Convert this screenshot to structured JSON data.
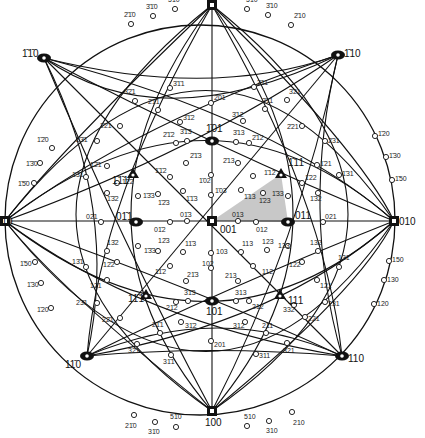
{
  "diagram": {
    "type": "stereographic-projection",
    "center": {
      "x": 212,
      "y": 221
    },
    "radius": 192,
    "shading_color": "#c8c8c8",
    "line_color": "#111111"
  },
  "fundamental_triangle": [
    [
      212,
      221
    ],
    [
      281,
      174
    ],
    [
      288,
      222
    ]
  ],
  "major_poles": [
    {
      "label": "1̄00",
      "x": 212,
      "y": 5,
      "shape": "square",
      "lx": 206,
      "ly": -3
    },
    {
      "label": "100",
      "x": 212,
      "y": 411,
      "shape": "square",
      "lx": 205,
      "ly": 426
    },
    {
      "label": "010",
      "x": 5,
      "y": 221,
      "shape": "square",
      "lx": -4,
      "ly": 225
    },
    {
      "label": "010",
      "x": 394,
      "y": 221,
      "shape": "square",
      "lx": 399,
      "ly": 225
    },
    {
      "label": "001",
      "x": 212,
      "y": 221,
      "shape": "square",
      "lx": 220,
      "ly": 233
    },
    {
      "label": "1̄1̄0",
      "x": 44,
      "y": 58,
      "shape": "oval",
      "lx": 22,
      "ly": 57
    },
    {
      "label": "1̄10",
      "x": 338,
      "y": 55,
      "shape": "oval",
      "lx": 344,
      "ly": 57
    },
    {
      "label": "11̄0",
      "x": 87,
      "y": 356,
      "shape": "oval",
      "lx": 65,
      "ly": 368
    },
    {
      "label": "110",
      "x": 342,
      "y": 356,
      "shape": "oval",
      "lx": 348,
      "ly": 362
    },
    {
      "label": "1̄01",
      "x": 212,
      "y": 141,
      "shape": "oval",
      "lx": 206,
      "ly": 132
    },
    {
      "label": "101",
      "x": 212,
      "y": 301,
      "shape": "oval",
      "lx": 206,
      "ly": 315
    },
    {
      "label": "01̄1",
      "x": 136,
      "y": 222,
      "shape": "oval",
      "lx": 116,
      "ly": 220
    },
    {
      "label": "011",
      "x": 288,
      "y": 222,
      "shape": "oval",
      "lx": 295,
      "ly": 219
    },
    {
      "label": "1̄1̄1",
      "x": 133,
      "y": 174,
      "shape": "triangle",
      "lx": 112,
      "ly": 184
    },
    {
      "label": "1̄11",
      "x": 281,
      "y": 174,
      "shape": "triangle",
      "lx": 288,
      "ly": 166
    },
    {
      "label": "11̄1",
      "x": 146,
      "y": 295,
      "shape": "triangle",
      "lx": 128,
      "ly": 302
    },
    {
      "label": "111",
      "x": 280,
      "y": 295,
      "shape": "triangle",
      "lx": 288,
      "ly": 304
    }
  ],
  "minor_poles": [
    {
      "label": "5̄1̄0",
      "x": 175,
      "y": 9,
      "lx": 168,
      "ly": 2
    },
    {
      "label": "3̄1̄0",
      "x": 153,
      "y": 16,
      "lx": 146,
      "ly": 9
    },
    {
      "label": "2̄1̄0",
      "x": 131,
      "y": 24,
      "lx": 124,
      "ly": 17
    },
    {
      "label": "5̄10",
      "x": 247,
      "y": 9,
      "lx": 246,
      "ly": 2
    },
    {
      "label": "3̄10",
      "x": 268,
      "y": 15,
      "lx": 266,
      "ly": 8
    },
    {
      "label": "2̄10",
      "x": 291,
      "y": 25,
      "lx": 294,
      "ly": 18
    },
    {
      "label": "1̄2̄0",
      "x": 52,
      "y": 148,
      "lx": 37,
      "ly": 142
    },
    {
      "label": "1̄3̄0",
      "x": 40,
      "y": 163,
      "lx": 26,
      "ly": 166
    },
    {
      "label": "1̄5̄0",
      "x": 34,
      "y": 183,
      "lx": 18,
      "ly": 186
    },
    {
      "label": "1̄20",
      "x": 375,
      "y": 136,
      "lx": 378,
      "ly": 136
    },
    {
      "label": "1̄30",
      "x": 386,
      "y": 157,
      "lx": 389,
      "ly": 158
    },
    {
      "label": "1̄50",
      "x": 392,
      "y": 180,
      "lx": 395,
      "ly": 181
    },
    {
      "label": "1̄50",
      "x": 35,
      "y": 262,
      "lx": 20,
      "ly": 266
    },
    {
      "label": "1̄30",
      "x": 41,
      "y": 283,
      "lx": 27,
      "ly": 287
    },
    {
      "label": "1̄20",
      "x": 51,
      "y": 308,
      "lx": 37,
      "ly": 312
    },
    {
      "label": "150",
      "x": 389,
      "y": 261,
      "lx": 392,
      "ly": 262
    },
    {
      "label": "130",
      "x": 384,
      "y": 280,
      "lx": 387,
      "ly": 282
    },
    {
      "label": "120",
      "x": 374,
      "y": 304,
      "lx": 377,
      "ly": 306
    },
    {
      "label": "21̄0",
      "x": 134,
      "y": 415,
      "lx": 125,
      "ly": 428
    },
    {
      "label": "31̄0",
      "x": 155,
      "y": 422,
      "lx": 148,
      "ly": 434
    },
    {
      "label": "51̄0",
      "x": 176,
      "y": 427,
      "lx": 170,
      "ly": 419
    },
    {
      "label": "510",
      "x": 247,
      "y": 426,
      "lx": 244,
      "ly": 419
    },
    {
      "label": "310",
      "x": 269,
      "y": 421,
      "lx": 266,
      "ly": 433
    },
    {
      "label": "210",
      "x": 292,
      "y": 412,
      "lx": 293,
      "ly": 425
    },
    {
      "label": "3̄2̄1",
      "x": 135,
      "y": 101,
      "lx": 124,
      "ly": 94
    },
    {
      "label": "2̄1̄1",
      "x": 158,
      "y": 110,
      "lx": 148,
      "ly": 104
    },
    {
      "label": "3̄1̄1",
      "x": 170,
      "y": 88,
      "lx": 173,
      "ly": 86
    },
    {
      "label": "2̄01",
      "x": 211,
      "y": 103,
      "lx": 214,
      "ly": 100
    },
    {
      "label": "3̄11",
      "x": 254,
      "y": 87,
      "lx": 257,
      "ly": 85
    },
    {
      "label": "3̄21",
      "x": 287,
      "y": 100,
      "lx": 289,
      "ly": 94
    },
    {
      "label": "2̄11",
      "x": 265,
      "y": 109,
      "lx": 262,
      "ly": 103
    },
    {
      "label": "2̄2̄1",
      "x": 120,
      "y": 126,
      "lx": 100,
      "ly": 128
    },
    {
      "label": "2̄21",
      "x": 302,
      "y": 126,
      "lx": 287,
      "ly": 129
    },
    {
      "label": "3̄1̄2",
      "x": 180,
      "y": 122,
      "lx": 183,
      "ly": 120
    },
    {
      "label": "3̄12",
      "x": 243,
      "y": 121,
      "lx": 232,
      "ly": 117
    },
    {
      "label": "2̄1̄2",
      "x": 176,
      "y": 143,
      "lx": 163,
      "ly": 137
    },
    {
      "label": "3̄1̄3",
      "x": 187,
      "y": 141,
      "lx": 180,
      "ly": 134
    },
    {
      "label": "3̄13",
      "x": 236,
      "y": 142,
      "lx": 233,
      "ly": 135
    },
    {
      "label": "2̄12",
      "x": 249,
      "y": 143,
      "lx": 252,
      "ly": 140
    },
    {
      "label": "2̄3̄1",
      "x": 97,
      "y": 141,
      "lx": 76,
      "ly": 142
    },
    {
      "label": "2̄31",
      "x": 325,
      "y": 141,
      "lx": 328,
      "ly": 143
    },
    {
      "label": "1̄2̄1",
      "x": 107,
      "y": 166,
      "lx": 90,
      "ly": 167
    },
    {
      "label": "1̄21",
      "x": 317,
      "y": 165,
      "lx": 320,
      "ly": 166
    },
    {
      "label": "1̄3̄1",
      "x": 86,
      "y": 177,
      "lx": 72,
      "ly": 177
    },
    {
      "label": "1̄31",
      "x": 339,
      "y": 175,
      "lx": 342,
      "ly": 176
    },
    {
      "label": "1̄3̄2",
      "x": 107,
      "y": 193,
      "lx": 107,
      "ly": 201
    },
    {
      "label": "1̄32",
      "x": 318,
      "y": 193,
      "lx": 310,
      "ly": 201
    },
    {
      "label": "1̄2̄2",
      "x": 117,
      "y": 183,
      "lx": 122,
      "ly": 184
    },
    {
      "label": "1̄22",
      "x": 302,
      "y": 183,
      "lx": 305,
      "ly": 180
    },
    {
      "label": "1̄3̄3",
      "x": 138,
      "y": 196,
      "lx": 143,
      "ly": 198
    },
    {
      "label": "1̄33",
      "x": 288,
      "y": 196,
      "lx": 272,
      "ly": 196
    },
    {
      "label": "1̄2̄3",
      "x": 158,
      "y": 194,
      "lx": 158,
      "ly": 205
    },
    {
      "label": "1̄23",
      "x": 263,
      "y": 193,
      "lx": 259,
      "ly": 203
    },
    {
      "label": "1̄1̄2",
      "x": 170,
      "y": 177,
      "lx": 155,
      "ly": 173
    },
    {
      "label": "1̄12",
      "x": 253,
      "y": 176,
      "lx": 264,
      "ly": 175
    },
    {
      "label": "1̄1̄3",
      "x": 183,
      "y": 191,
      "lx": 186,
      "ly": 201
    },
    {
      "label": "1̄13",
      "x": 241,
      "y": 190,
      "lx": 244,
      "ly": 199
    },
    {
      "label": "2̄1̄3",
      "x": 186,
      "y": 163,
      "lx": 190,
      "ly": 158
    },
    {
      "label": "2̄13",
      "x": 238,
      "y": 163,
      "lx": 223,
      "ly": 163
    },
    {
      "label": "1̄02",
      "x": 211,
      "y": 175,
      "lx": 199,
      "ly": 183
    },
    {
      "label": "1̄03",
      "x": 211,
      "y": 195,
      "lx": 215,
      "ly": 193
    },
    {
      "label": "01̄3",
      "x": 187,
      "y": 221,
      "lx": 180,
      "ly": 217
    },
    {
      "label": "013",
      "x": 238,
      "y": 221,
      "lx": 232,
      "ly": 217
    },
    {
      "label": "01̄2",
      "x": 170,
      "y": 222,
      "lx": 154,
      "ly": 232
    },
    {
      "label": "012",
      "x": 256,
      "y": 222,
      "lx": 256,
      "ly": 232
    },
    {
      "label": "02̄1",
      "x": 101,
      "y": 222,
      "lx": 86,
      "ly": 219
    },
    {
      "label": "021",
      "x": 323,
      "y": 222,
      "lx": 325,
      "ly": 219
    },
    {
      "label": "1̄3̄3",
      "x": 138,
      "y": 246,
      "lx": 144,
      "ly": 253
    },
    {
      "label": "133",
      "x": 288,
      "y": 246,
      "lx": 278,
      "ly": 248
    },
    {
      "label": "12̄3",
      "x": 158,
      "y": 251,
      "lx": 158,
      "ly": 243
    },
    {
      "label": "123",
      "x": 267,
      "y": 250,
      "lx": 262,
      "ly": 244
    },
    {
      "label": "11̄3",
      "x": 183,
      "y": 252,
      "lx": 185,
      "ly": 246
    },
    {
      "label": "113",
      "x": 241,
      "y": 252,
      "lx": 242,
      "ly": 246
    },
    {
      "label": "13̄2",
      "x": 107,
      "y": 251,
      "lx": 107,
      "ly": 245
    },
    {
      "label": "132",
      "x": 318,
      "y": 251,
      "lx": 310,
      "ly": 245
    },
    {
      "label": "12̄2",
      "x": 117,
      "y": 262,
      "lx": 103,
      "ly": 267
    },
    {
      "label": "122",
      "x": 302,
      "y": 262,
      "lx": 289,
      "ly": 267
    },
    {
      "label": "11̄2",
      "x": 170,
      "y": 266,
      "lx": 155,
      "ly": 274
    },
    {
      "label": "112",
      "x": 253,
      "y": 266,
      "lx": 262,
      "ly": 274
    },
    {
      "label": "103",
      "x": 211,
      "y": 253,
      "lx": 216,
      "ly": 254
    },
    {
      "label": "102",
      "x": 211,
      "y": 268,
      "lx": 202,
      "ly": 266
    },
    {
      "label": "21̄3",
      "x": 186,
      "y": 281,
      "lx": 187,
      "ly": 277
    },
    {
      "label": "213",
      "x": 238,
      "y": 281,
      "lx": 225,
      "ly": 278
    },
    {
      "label": "13̄1",
      "x": 86,
      "y": 267,
      "lx": 72,
      "ly": 264
    },
    {
      "label": "131",
      "x": 339,
      "y": 267,
      "lx": 338,
      "ly": 260
    },
    {
      "label": "12̄1",
      "x": 107,
      "y": 280,
      "lx": 90,
      "ly": 288
    },
    {
      "label": "121",
      "x": 317,
      "y": 280,
      "lx": 320,
      "ly": 288
    },
    {
      "label": "23̄1",
      "x": 97,
      "y": 303,
      "lx": 76,
      "ly": 305
    },
    {
      "label": "231",
      "x": 325,
      "y": 302,
      "lx": 328,
      "ly": 306
    },
    {
      "label": "22̄1",
      "x": 120,
      "y": 318,
      "lx": 102,
      "ly": 322
    },
    {
      "label": "221",
      "x": 305,
      "y": 317,
      "lx": 308,
      "ly": 321
    },
    {
      "label": "332",
      "x": 294,
      "y": 305,
      "lx": 283,
      "ly": 312
    },
    {
      "label": "21̄2",
      "x": 176,
      "y": 302,
      "lx": 166,
      "ly": 310
    },
    {
      "label": "31̄3",
      "x": 188,
      "y": 301,
      "lx": 184,
      "ly": 295
    },
    {
      "label": "313",
      "x": 236,
      "y": 301,
      "lx": 235,
      "ly": 295
    },
    {
      "label": "212",
      "x": 249,
      "y": 301,
      "lx": 252,
      "ly": 309
    },
    {
      "label": "31̄2",
      "x": 181,
      "y": 322,
      "lx": 185,
      "ly": 328
    },
    {
      "label": "312",
      "x": 245,
      "y": 322,
      "lx": 233,
      "ly": 328
    },
    {
      "label": "21̄1",
      "x": 160,
      "y": 333,
      "lx": 152,
      "ly": 327
    },
    {
      "label": "211",
      "x": 266,
      "y": 333,
      "lx": 262,
      "ly": 328
    },
    {
      "label": "32̄1",
      "x": 137,
      "y": 344,
      "lx": 128,
      "ly": 353
    },
    {
      "label": "321",
      "x": 287,
      "y": 343,
      "lx": 283,
      "ly": 353
    },
    {
      "label": "201",
      "x": 211,
      "y": 341,
      "lx": 214,
      "ly": 347
    },
    {
      "label": "31̄1",
      "x": 171,
      "y": 355,
      "lx": 163,
      "ly": 364
    },
    {
      "label": "311",
      "x": 256,
      "y": 354,
      "lx": 259,
      "ly": 358
    }
  ],
  "great_circles": [
    "M5,221 L394,221",
    "M212,5 L212,411",
    "M44,58 L342,356",
    "M338,55 L87,356",
    "M5,221 Q212,60 394,221",
    "M5,221 Q212,382 394,221",
    "M212,5 Q50,221 212,411",
    "M212,5 Q374,221 212,411",
    "M5,221 Q212,-40 394,221",
    "M5,221 Q212,482 394,221",
    "M212,5 Q-60,221 212,411",
    "M212,5 Q484,221 212,411",
    "M44,58 Q120,240 212,411",
    "M338,55 Q300,240 212,411",
    "M87,356 Q100,200 212,5",
    "M342,356 Q325,200 212,5",
    "M44,58 Q220,150 394,221",
    "M338,55 Q200,150 5,221",
    "M87,356 Q220,290 394,221",
    "M342,356 Q200,290 5,221",
    "M44,58 Q160,140 338,55",
    "M87,356 Q220,300 342,356",
    "M44,58 Q120,210 87,356",
    "M338,55 Q300,210 342,356",
    "M5,221 Q140,120 338,55",
    "M5,221 Q140,322 342,356",
    "M394,221 Q280,120 44,58",
    "M394,221 Q280,322 87,356",
    "M212,5 Q60,150 5,221",
    "M212,5 Q360,150 394,221",
    "M212,411 Q60,290 5,221",
    "M212,411 Q360,290 394,221",
    "M44,58 Q212,100 338,55",
    "M87,356 Q212,345 342,356"
  ]
}
